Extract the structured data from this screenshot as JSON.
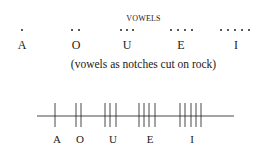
{
  "title": "VOWELS",
  "vowels": [
    {
      "letter": "A",
      "dots": 1,
      "notches": 1
    },
    {
      "letter": "O",
      "dots": 2,
      "notches": 2
    },
    {
      "letter": "U",
      "dots": 3,
      "notches": 3
    },
    {
      "letter": "E",
      "dots": 4,
      "notches": 4
    },
    {
      "letter": "I",
      "dots": 5,
      "notches": 5
    }
  ],
  "caption": "(vowels as notches cut on rock)",
  "tally_labels": [
    "A",
    "O",
    "U",
    "E",
    "I"
  ],
  "colors": {
    "ink": "#1a1a1a",
    "background": "#ffffff"
  }
}
